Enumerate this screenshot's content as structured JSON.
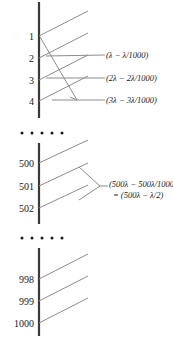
{
  "figure": {
    "axis": {
      "name": "vertical-bar",
      "color": "#3a3a3a"
    },
    "ray_color": "#8c8c8c",
    "leader_color": "#8c8c8c",
    "groups": [
      {
        "id": "top",
        "labels": [
          "1",
          "2",
          "3",
          "4"
        ],
        "annotations": [
          {
            "text": "(λ − λ/1000)",
            "line2": ""
          },
          {
            "text": "(2λ − 2λ/1000)",
            "line2": ""
          },
          {
            "text": "(3λ − 3λ/1000)",
            "line2": ""
          }
        ]
      },
      {
        "id": "middle",
        "labels": [
          "500",
          "501",
          "502"
        ],
        "annotations": [
          {
            "text": "(500λ − 500λ/1000)",
            "line2": "= (500λ − λ/2)"
          }
        ]
      },
      {
        "id": "bottom",
        "labels": [
          "998",
          "999",
          "1000"
        ],
        "annotations": []
      }
    ],
    "ellipses": [
      {
        "id": "ellipsis-top",
        "dots": 5
      },
      {
        "id": "ellipsis-bottom",
        "dots": 5
      }
    ]
  },
  "text": {
    "n1": "1",
    "n2": "2",
    "n3": "3",
    "n4": "4",
    "n500": "500",
    "n501": "501",
    "n502": "502",
    "n998": "998",
    "n999": "999",
    "n1000": "1000",
    "a1": "(λ − λ/1000)",
    "a2": "(2λ − 2λ/1000)",
    "a3": "(3λ − 3λ/1000)",
    "a4": "(500λ − 500λ/1000)",
    "a4b": "= (500λ − λ/2)"
  }
}
